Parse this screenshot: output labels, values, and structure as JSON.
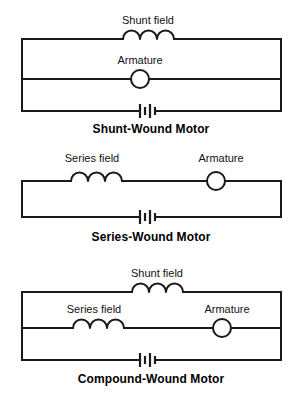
{
  "figure": {
    "kind": "electrical-schematic-set",
    "background_color": "#ffffff",
    "line_color": "#1a1a1a",
    "text_color": "#111111",
    "title_color": "#000000"
  },
  "circuits": [
    {
      "id": "shunt-wound",
      "title": "Shunt-Wound Motor",
      "topology": "parallel",
      "components": [
        {
          "type": "inductor",
          "name": "shunt-field",
          "label": "Shunt field",
          "coils": 3,
          "branch": "top"
        },
        {
          "type": "armature",
          "name": "armature",
          "label": "Armature",
          "branch": "middle"
        },
        {
          "type": "battery",
          "name": "battery",
          "label": "",
          "cells": 2,
          "branch": "bottom"
        }
      ],
      "labels": {
        "field": "Shunt field",
        "armature": "Armature"
      }
    },
    {
      "id": "series-wound",
      "title": "Series-Wound Motor",
      "topology": "series",
      "components": [
        {
          "type": "inductor",
          "name": "series-field",
          "label": "Series field",
          "coils": 3,
          "branch": "top"
        },
        {
          "type": "armature",
          "name": "armature",
          "label": "Armature",
          "branch": "top"
        },
        {
          "type": "battery",
          "name": "battery",
          "label": "",
          "cells": 2,
          "branch": "bottom"
        }
      ],
      "labels": {
        "field": "Series field",
        "armature": "Armature"
      }
    },
    {
      "id": "compound-wound",
      "title": "Compound-Wound Motor",
      "topology": "compound",
      "components": [
        {
          "type": "inductor",
          "name": "shunt-field",
          "label": "Shunt field",
          "coils": 3,
          "branch": "top"
        },
        {
          "type": "inductor",
          "name": "series-field",
          "label": "Series field",
          "coils": 3,
          "branch": "middle"
        },
        {
          "type": "armature",
          "name": "armature",
          "label": "Armature",
          "branch": "middle"
        },
        {
          "type": "battery",
          "name": "battery",
          "label": "",
          "cells": 2,
          "branch": "bottom"
        }
      ],
      "labels": {
        "shunt_field": "Shunt field",
        "series_field": "Series field",
        "armature": "Armature"
      }
    }
  ]
}
